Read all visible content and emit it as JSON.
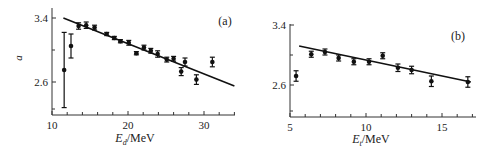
{
  "chart_data": [
    {
      "type": "scatter",
      "panel_label": "(a)",
      "title": "",
      "xlabel": "E_d/MeV",
      "xlabel_main": "E",
      "xlabel_sub": "d",
      "xlabel_unit": "/MeV",
      "ylabel": "a",
      "xlim": [
        10,
        34
      ],
      "ylim": [
        2.3,
        3.5
      ],
      "xticks": [
        10,
        20,
        30
      ],
      "yticks": [
        2.6,
        3.4
      ],
      "grid": false,
      "series": [
        {
          "name": "data",
          "x": [
            11.6,
            12.5,
            13.5,
            14.5,
            15.6,
            17.2,
            18.2,
            19.0,
            20.1,
            21.1,
            22.1,
            23.0,
            23.9,
            25.1,
            26.0,
            27.0,
            27.5,
            29.0,
            31.1
          ],
          "y": [
            2.75,
            3.05,
            3.3,
            3.31,
            3.28,
            3.2,
            3.15,
            3.11,
            3.09,
            2.96,
            3.03,
            2.99,
            2.95,
            2.88,
            2.89,
            2.73,
            2.85,
            2.63,
            2.85
          ],
          "yerr": [
            0.47,
            0.15,
            0.04,
            0.04,
            0.03,
            0.02,
            0.02,
            0.02,
            0.03,
            0.02,
            0.03,
            0.03,
            0.04,
            0.03,
            0.03,
            0.05,
            0.05,
            0.06,
            0.06
          ]
        },
        {
          "name": "fit",
          "type": "line",
          "x": [
            11.5,
            34.0
          ],
          "y": [
            3.4,
            2.55
          ]
        }
      ]
    },
    {
      "type": "scatter",
      "panel_label": "(b)",
      "title": "",
      "xlabel": "E_t/MeV",
      "xlabel_main": "E",
      "xlabel_sub": "t",
      "xlabel_unit": "/MeV",
      "ylabel": "",
      "xlim": [
        5,
        17
      ],
      "ylim": [
        2.2,
        3.4
      ],
      "xticks": [
        5,
        10,
        15
      ],
      "yticks": [
        2.6,
        3.4
      ],
      "grid": false,
      "series": [
        {
          "name": "data",
          "x": [
            5.4,
            6.4,
            7.3,
            8.2,
            9.2,
            10.2,
            11.1,
            12.1,
            13.0,
            14.3,
            16.7
          ],
          "y": [
            2.72,
            3.01,
            3.04,
            2.96,
            2.91,
            2.91,
            2.99,
            2.83,
            2.8,
            2.65,
            2.64
          ],
          "yerr": [
            0.07,
            0.04,
            0.04,
            0.04,
            0.04,
            0.04,
            0.04,
            0.05,
            0.05,
            0.07,
            0.07
          ]
        },
        {
          "name": "fit",
          "type": "line",
          "x": [
            5.6,
            16.9
          ],
          "y": [
            3.12,
            2.64
          ]
        }
      ]
    }
  ]
}
